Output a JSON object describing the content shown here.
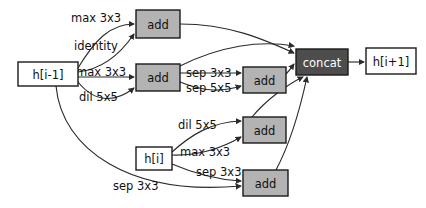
{
  "diagram": {
    "colors": {
      "background": "#ffffff",
      "node_io_fill": "#ffffff",
      "node_add_fill": "#b3b3b3",
      "node_concat_fill": "#4d4d4d",
      "stroke": "#1a1a1a",
      "edge": "#2b2b2b",
      "text": "#111111",
      "text_light": "#ffffff"
    },
    "nodes": [
      {
        "id": "h_prev",
        "label": "h[i-1]",
        "kind": "io",
        "x": 18,
        "y": 62,
        "w": 60,
        "h": 24
      },
      {
        "id": "h_cur",
        "label": "h[i]",
        "kind": "io",
        "x": 136,
        "y": 147,
        "w": 36,
        "h": 23
      },
      {
        "id": "add1",
        "label": "add",
        "kind": "add",
        "x": 136,
        "y": 10,
        "w": 44,
        "h": 28
      },
      {
        "id": "add2",
        "label": "add",
        "kind": "add",
        "x": 136,
        "y": 64,
        "w": 44,
        "h": 27
      },
      {
        "id": "add3",
        "label": "add",
        "kind": "add",
        "x": 243,
        "y": 67,
        "w": 43,
        "h": 26
      },
      {
        "id": "add4",
        "label": "add",
        "kind": "add",
        "x": 243,
        "y": 117,
        "w": 43,
        "h": 26
      },
      {
        "id": "add5",
        "label": "add",
        "kind": "add",
        "x": 243,
        "y": 170,
        "w": 45,
        "h": 26
      },
      {
        "id": "concat",
        "label": "concat",
        "kind": "concat",
        "x": 296,
        "y": 49,
        "w": 52,
        "h": 26
      },
      {
        "id": "h_next",
        "label": "h[i+1]",
        "kind": "io",
        "x": 366,
        "y": 48,
        "w": 50,
        "h": 26
      }
    ],
    "edges": [
      {
        "id": "e1",
        "from": "h_prev",
        "to": "add1",
        "op": "max 3x3",
        "label_x": 71,
        "label_y": 18,
        "path": "M 78 68 C 95 40 110 24 134 24"
      },
      {
        "id": "e2",
        "from": "h_prev",
        "to": "add1",
        "op": "identity",
        "label_x": 74,
        "label_y": 46,
        "path": "M 78 72 C 95 70 115 62 134 34"
      },
      {
        "id": "e3",
        "from": "h_prev",
        "to": "add2",
        "op": "max 3x3",
        "label_x": 76,
        "label_y": 72,
        "path": "M 78 77 L 134 77"
      },
      {
        "id": "e4",
        "from": "h_prev",
        "to": "add2",
        "op": "dil 5x5",
        "label_x": 79,
        "label_y": 97,
        "path": "M 78 82 C 96 104 116 102 134 88"
      },
      {
        "id": "e5",
        "from": "add2",
        "to": "add3",
        "op": "sep 3x3",
        "label_x": 186,
        "label_y": 73,
        "path": "M 180 73 L 241 73"
      },
      {
        "id": "e6",
        "from": "add2",
        "to": "add3",
        "op": "sep 5x5",
        "label_x": 186,
        "label_y": 88,
        "path": "M 180 82 C 205 92 222 92 241 86"
      },
      {
        "id": "e7",
        "from": "h_cur",
        "to": "add4",
        "op": "dil 5x5",
        "label_x": 178,
        "label_y": 125,
        "path": "M 172 152 C 192 134 212 122 241 121"
      },
      {
        "id": "e8",
        "from": "h_cur",
        "to": "add4",
        "op": "max 3x3",
        "label_x": 180,
        "label_y": 152,
        "path": "M 172 155 C 200 156 222 148 241 137"
      },
      {
        "id": "e9",
        "from": "h_cur",
        "to": "add5",
        "op": "sep 3x3",
        "label_x": 196,
        "label_y": 172,
        "path": "M 172 164 C 200 176 220 180 241 181"
      },
      {
        "id": "e10",
        "from": "h_prev",
        "to": "add5",
        "op": "sep 3x3",
        "label_x": 113,
        "label_y": 186,
        "path": "M 56 86 C 62 150 130 196 241 186"
      },
      {
        "id": "e11",
        "from": "add1",
        "to": "concat",
        "op": "",
        "label_x": 0,
        "label_y": 0,
        "path": "M 180 24 C 230 24 265 40 294 53"
      },
      {
        "id": "e12",
        "from": "add3",
        "to": "concat",
        "op": "",
        "label_x": 0,
        "label_y": 0,
        "path": "M 286 74 C 290 70 291 68 294 64"
      },
      {
        "id": "e13",
        "from": "add2",
        "to": "concat",
        "op": "",
        "label_x": 0,
        "label_y": 0,
        "path": "M 180 66 C 220 46 260 40 294 46"
      },
      {
        "id": "e14",
        "from": "add4",
        "to": "concat",
        "op": "",
        "label_x": 0,
        "label_y": 0,
        "path": "M 252 117 C 266 100 288 84 303 77"
      },
      {
        "id": "e15",
        "from": "add5",
        "to": "concat",
        "op": "",
        "label_x": 0,
        "label_y": 0,
        "path": "M 276 170 C 292 140 302 100 307 77"
      },
      {
        "id": "e16",
        "from": "concat",
        "to": "h_next",
        "op": "",
        "label_x": 0,
        "label_y": 0,
        "path": "M 348 62 L 364 62"
      }
    ]
  }
}
